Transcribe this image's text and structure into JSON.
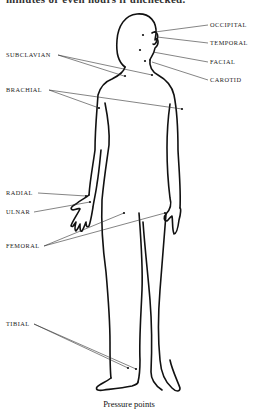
{
  "header": {
    "cut_off_text": "minutes or even hours if unchecked."
  },
  "figure": {
    "title": "Pressure points",
    "labels": {
      "occipital": "OCCIPITAL",
      "temporal": "TEMPORAL",
      "facial": "FACIAL",
      "carotid": "CAROTID",
      "subclavian": "SUBCLAVIAN",
      "brachial": "BRACHIAL",
      "radial": "RADIAL",
      "ulnar": "ULNAR",
      "femoral": "FEMORAL",
      "tibial": "TIBIAL"
    }
  }
}
